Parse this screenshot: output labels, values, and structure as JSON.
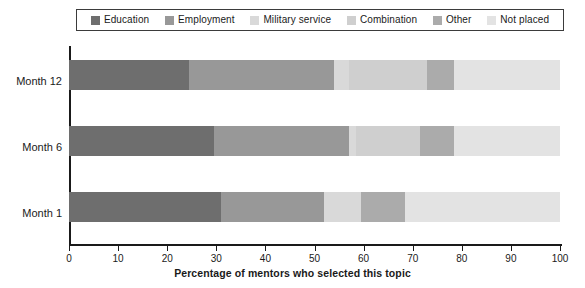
{
  "chart_data": {
    "type": "bar",
    "orientation": "horizontal",
    "stacked": true,
    "title": "",
    "xlabel": "Percentage of mentors who selected this topic",
    "ylabel": "",
    "xlim": [
      0,
      100
    ],
    "xticks": [
      0,
      10,
      20,
      30,
      40,
      50,
      60,
      70,
      80,
      90,
      100
    ],
    "grid": false,
    "legend_position": "top",
    "categories": [
      "Month 12",
      "Month 6",
      "Month 1"
    ],
    "series": [
      {
        "name": "Education",
        "color": "#6e6e6e",
        "values": [
          24.5,
          29.5,
          31.0
        ]
      },
      {
        "name": "Employment",
        "color": "#989898",
        "values": [
          29.5,
          27.5,
          21.0
        ]
      },
      {
        "name": "Military service",
        "color": "#d9d9d9",
        "values": [
          3.0,
          1.5,
          7.5
        ]
      },
      {
        "name": "Combination",
        "color": "#cfcfcf",
        "values": [
          16.0,
          13.0,
          0.0
        ]
      },
      {
        "name": "Other",
        "color": "#ababab",
        "values": [
          5.5,
          7.0,
          9.0
        ]
      },
      {
        "name": "Not placed",
        "color": "#e3e3e3",
        "values": [
          21.5,
          21.5,
          31.5
        ]
      }
    ],
    "stack_order": [
      "Education",
      "Employment",
      "Military service",
      "Combination",
      "Other",
      "Not placed"
    ]
  },
  "legend": {
    "items": [
      {
        "label": "Education",
        "color": "#6e6e6e",
        "swatch_name": "legend-swatch-education"
      },
      {
        "label": "Employment",
        "color": "#989898",
        "swatch_name": "legend-swatch-employment"
      },
      {
        "label": "Military service",
        "color": "#d9d9d9",
        "swatch_name": "legend-swatch-military-service"
      },
      {
        "label": "Combination",
        "color": "#cfcfcf",
        "swatch_name": "legend-swatch-combination"
      },
      {
        "label": "Other",
        "color": "#ababab",
        "swatch_name": "legend-swatch-other"
      },
      {
        "label": "Not placed",
        "color": "#e3e3e3",
        "swatch_name": "legend-swatch-not-placed"
      }
    ]
  },
  "axis": {
    "x_title": "Percentage of mentors who selected this topic",
    "x_tick_labels": [
      "0",
      "10",
      "20",
      "30",
      "40",
      "50",
      "60",
      "70",
      "80",
      "90",
      "100"
    ],
    "y_tick_labels": [
      "Month 12",
      "Month 6",
      "Month 1"
    ]
  },
  "colors": {
    "axis": "#1a1a1a",
    "legend_border": "#3b3b3b",
    "background": "#ffffff"
  }
}
